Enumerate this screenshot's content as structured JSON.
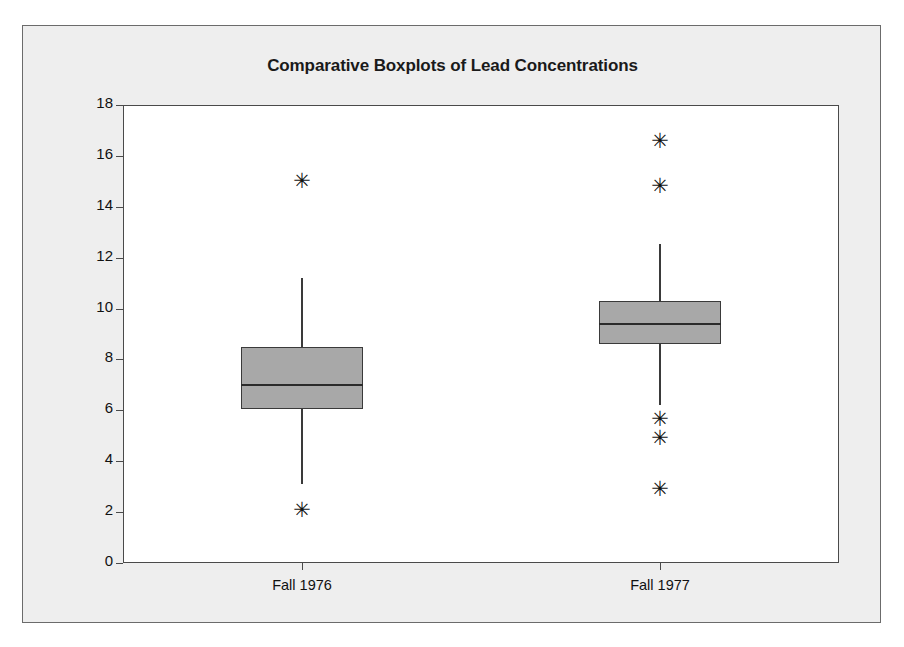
{
  "chart_data": {
    "type": "box",
    "title": "Comparative Boxplots of Lead Concentrations",
    "xlabel": "",
    "ylabel": "Lead Concentrations (mg/ m3)",
    "ylabel_base": "Lead Concentrations ( mg/ m",
    "ylabel_sup": "3",
    "ylabel_close": " )",
    "ylim": [
      0,
      18
    ],
    "yticks": [
      0,
      2,
      4,
      6,
      8,
      10,
      12,
      14,
      16,
      18
    ],
    "ytick_labels": [
      "0",
      "2",
      "4",
      "6",
      "8",
      "10",
      "12",
      "14",
      "16",
      "18"
    ],
    "grid": false,
    "legend": false,
    "categories": [
      "Fall 1976",
      "Fall 1977"
    ],
    "boxes": [
      {
        "label": "Fall 1976",
        "whisker_low": 3.1,
        "q1": 6.05,
        "median": 7.0,
        "q3": 8.5,
        "whisker_high": 11.2,
        "outliers": [
          2.1,
          15.0
        ]
      },
      {
        "label": "Fall 1977",
        "whisker_low": 6.2,
        "q1": 8.6,
        "median": 9.4,
        "q3": 10.3,
        "whisker_high": 12.55,
        "outliers": [
          2.9,
          4.9,
          5.65,
          14.8,
          16.6
        ]
      }
    ],
    "colors": {
      "box_fill": "#a8a8a8",
      "box_edge": "#3a3a3a",
      "median": "#2b2b2b",
      "outlier": "#111111",
      "panel_background": "#ffffff",
      "figure_background": "#eeeeee",
      "frame": "#6b6b6b",
      "text": "#111111"
    },
    "outlier_marker": "✳"
  }
}
